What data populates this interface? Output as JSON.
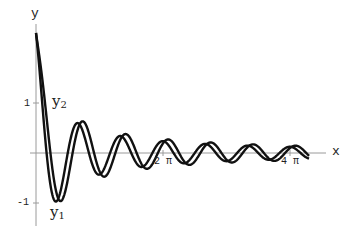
{
  "chart_data": {
    "type": "line",
    "title": "",
    "xlabel": "x",
    "ylabel": "y",
    "xlim": [
      0,
      4.3
    ],
    "x_unit": "pi",
    "ylim": [
      -1.3,
      2.4
    ],
    "grid": false,
    "legend": "inline curve labels",
    "x_ticks": [
      {
        "value_pi": 2,
        "label": "2 π"
      },
      {
        "value_pi": 4,
        "label": "4 π"
      }
    ],
    "y_ticks": [
      {
        "value": 1,
        "label": "1"
      },
      {
        "value": -1,
        "label": "-1"
      }
    ],
    "series": [
      {
        "name": "Y1",
        "label": "y",
        "subscript": "1",
        "model": "2.4*cos(3x)/(1+1.45x)",
        "x_pi": [
          0,
          0.05,
          0.1,
          0.15,
          0.2,
          0.25,
          0.3,
          0.35,
          0.4,
          0.5,
          0.67,
          1.0,
          1.33,
          1.67,
          2.0,
          2.33,
          2.67,
          3.0,
          3.33,
          3.67,
          4.0,
          4.2
        ],
        "values": [
          2.4,
          1.45,
          0.19,
          -0.75,
          -0.95,
          -0.73,
          -0.32,
          0.13,
          0.42,
          0.0,
          0.33,
          -0.26,
          0.2,
          -0.17,
          0.24,
          -0.13,
          0.11,
          -0.16,
          0.09,
          -0.08,
          0.12,
          0.1
        ]
      },
      {
        "name": "Y2",
        "label": "y",
        "subscript": "2",
        "model": "2.4*cos(3x-0.42x/(1+x))/(1+1.2x)",
        "x_pi": [
          0,
          0.05,
          0.1,
          0.15,
          0.2,
          0.25,
          0.3,
          0.35,
          0.4,
          0.5,
          0.67,
          1.0,
          1.33,
          1.67,
          2.0,
          2.33,
          2.67,
          3.0,
          3.33,
          3.67,
          4.0,
          4.2
        ],
        "values": [
          2.4,
          1.65,
          0.62,
          -0.25,
          -0.58,
          -0.55,
          -0.28,
          0.08,
          0.36,
          0.12,
          0.2,
          -0.24,
          0.2,
          -0.15,
          0.2,
          -0.12,
          0.1,
          -0.14,
          0.08,
          -0.08,
          0.1,
          0.08
        ]
      }
    ]
  },
  "labels": {
    "x_axis": "x",
    "y_axis": "y",
    "tick_x_2pi": "2 π",
    "tick_x_4pi": "4 π",
    "tick_y_1": "1",
    "tick_y_neg1": "-1",
    "y1_main": "y",
    "y1_sub": "1",
    "y2_main": "y",
    "y2_sub": "2"
  }
}
